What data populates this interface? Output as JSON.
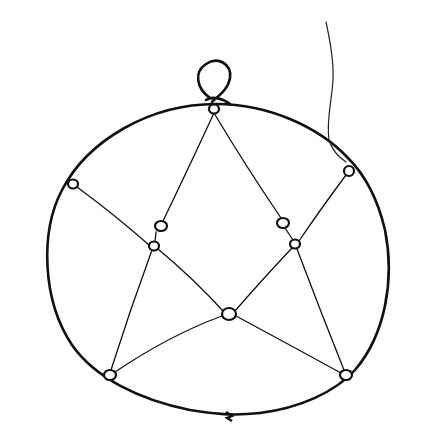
{
  "illustration": {
    "subject": "hand-drawn ring with star-shaped string net and beads",
    "colors": {
      "background": "#ffffff",
      "ink": "#111111"
    },
    "ring": {
      "path": "M 216 104 C 150 104 88 140 62 190 C 40 232 42 300 72 345 C 95 378 140 400 190 410 C 215 414 232 416 260 413 C 300 408 335 392 355 370 C 385 335 395 280 385 230 C 378 200 365 175 348 158 C 320 128 270 104 216 104 Z",
      "stroke_width": 2.6
    },
    "hanging_loop": {
      "path": "M 210 98 C 196 88 194 72 206 64 C 218 56 232 64 230 78 C 228 90 218 96 212 102 M 206 100 C 212 96 222 98 230 104"
    },
    "thread": {
      "path": "M 326 22 C 330 40 334 60 333 80 C 332 100 326 120 329 140 C 332 150 340 158 346 162"
    },
    "knot": {
      "x": 229,
      "y": 416
    },
    "beads": [
      {
        "id": "top",
        "cx": 214,
        "cy": 109,
        "rx": 5,
        "ry": 4.5
      },
      {
        "id": "left-outer",
        "cx": 73,
        "cy": 184,
        "rx": 5,
        "ry": 4.5
      },
      {
        "id": "right-outer",
        "cx": 349,
        "cy": 171,
        "rx": 5,
        "ry": 5
      },
      {
        "id": "left-inner-upper",
        "cx": 161,
        "cy": 226,
        "rx": 6,
        "ry": 5
      },
      {
        "id": "left-inner-lower",
        "cx": 154,
        "cy": 246,
        "rx": 5,
        "ry": 4.5
      },
      {
        "id": "right-inner-upper",
        "cx": 283,
        "cy": 223,
        "rx": 6,
        "ry": 5
      },
      {
        "id": "right-inner-lower",
        "cx": 295,
        "cy": 244,
        "rx": 5,
        "ry": 4.5
      },
      {
        "id": "center-bottom",
        "cx": 229,
        "cy": 314,
        "rx": 7,
        "ry": 6
      },
      {
        "id": "bottom-left",
        "cx": 110,
        "cy": 375,
        "rx": 6,
        "ry": 5
      },
      {
        "id": "bottom-right",
        "cx": 346,
        "cy": 375,
        "rx": 6,
        "ry": 5
      }
    ],
    "strings": [
      {
        "d": "M 214 113 Q 190 165 163 221"
      },
      {
        "d": "M 214 113 Q 245 165 281 218"
      },
      {
        "d": "M 77 187 Q 115 215 149 245"
      },
      {
        "d": "M 346 175 Q 320 210 299 241"
      },
      {
        "d": "M 156 232 L 155 242"
      },
      {
        "d": "M 285 228 L 293 240"
      },
      {
        "d": "M 158 249 Q 195 280 223 311"
      },
      {
        "d": "M 292 248 Q 260 282 235 311"
      },
      {
        "d": "M 152 250 Q 130 310 111 370"
      },
      {
        "d": "M 297 249 Q 320 310 344 370"
      },
      {
        "d": "M 115 372 Q 170 335 222 316"
      },
      {
        "d": "M 236 316 Q 290 345 341 373"
      }
    ]
  }
}
